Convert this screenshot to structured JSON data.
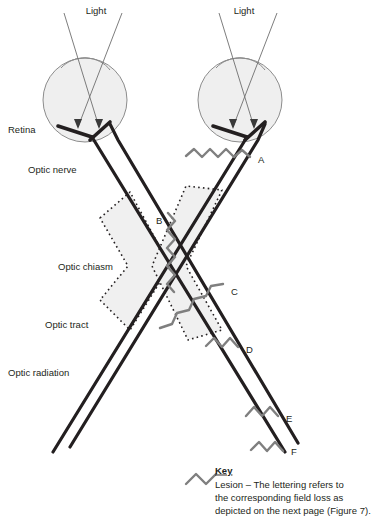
{
  "figure": {
    "background_color": "#ffffff"
  },
  "colors": {
    "nerve_stroke": "#231f20",
    "eye_fill": "#efefef",
    "eye_stroke": "#8c8c8c",
    "light_ray": "#6e6e6e",
    "lesion": "#7f7f7f",
    "chiasm_fill": "#f0f0f0",
    "chiasm_stroke": "#231f20",
    "text": "#231f20"
  },
  "light_labels": [
    {
      "id": "light-left",
      "text": "Light",
      "x": 96,
      "y": 11
    },
    {
      "id": "light-right",
      "text": "Light",
      "x": 244,
      "y": 11
    }
  ],
  "anatomy_labels": [
    {
      "id": "retina",
      "text": "Retina",
      "x": 8,
      "y": 130
    },
    {
      "id": "optic-nerve",
      "text": "Optic nerve",
      "x": 28,
      "y": 170
    },
    {
      "id": "optic-chiasm",
      "text": "Optic chiasm",
      "x": 58,
      "y": 267
    },
    {
      "id": "optic-tract",
      "text": "Optic tract",
      "x": 45,
      "y": 325
    },
    {
      "id": "optic-radiation",
      "text": "Optic radiation",
      "x": 8,
      "y": 373
    }
  ],
  "lesions": [
    {
      "id": "lesion-a",
      "letter": "A",
      "label_x": 258,
      "label_y": 160,
      "description": "Optic nerve lesion, right eye"
    },
    {
      "id": "lesion-b",
      "letter": "B",
      "label_x": 156,
      "label_y": 221,
      "description": "Optic chiasm lesion, central"
    },
    {
      "id": "lesion-c",
      "letter": "C",
      "label_x": 231,
      "label_y": 292,
      "description": "Optic chiasm lesion, lateral"
    },
    {
      "id": "lesion-d",
      "letter": "D",
      "label_x": 246,
      "label_y": 350,
      "description": "Optic tract lesion"
    },
    {
      "id": "lesion-e",
      "letter": "E",
      "label_x": 286,
      "label_y": 419,
      "description": "Optic radiation lesion"
    },
    {
      "id": "lesion-f",
      "letter": "F",
      "label_x": 291,
      "label_y": 452,
      "description": "Occipital lesion"
    }
  ],
  "key": {
    "heading": "Key",
    "lines": [
      "Lesion – The lettering refers to",
      "the corresponding field loss as",
      "depicted on the next page (Figure 7)."
    ],
    "heading_x": 215,
    "heading_y": 471,
    "line_x": 215,
    "line_start_y": 485,
    "line_height": 13,
    "symbol_x": 186,
    "symbol_y": 481
  },
  "eyes": [
    {
      "id": "eye-left",
      "cx": 85,
      "cy": 100,
      "r": 42
    },
    {
      "id": "eye-right",
      "cx": 240,
      "cy": 100,
      "r": 42
    }
  ]
}
